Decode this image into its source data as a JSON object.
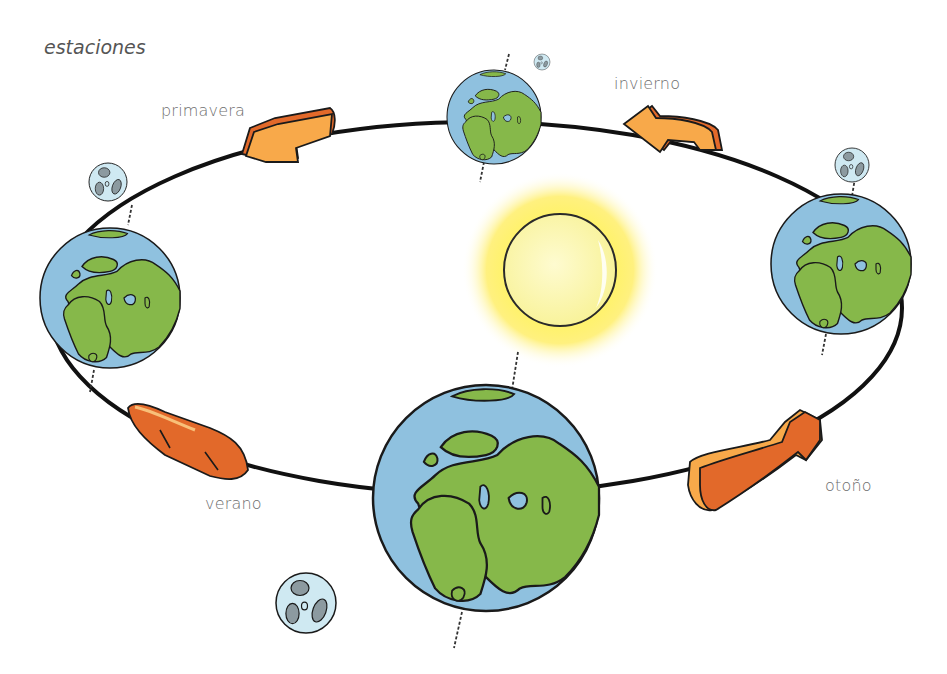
{
  "diagram": {
    "title": "estaciones",
    "seasons": [
      {
        "id": "primavera",
        "label": "primavera"
      },
      {
        "id": "invierno",
        "label": "invierno"
      },
      {
        "id": "verano",
        "label": "verano"
      },
      {
        "id": "otono",
        "label": "otoño"
      }
    ],
    "bodies": {
      "sun": {
        "name": "sun"
      },
      "earth_positions": [
        "top",
        "left",
        "right",
        "bottom"
      ],
      "moon_count": 4
    },
    "colors": {
      "ocean": "#8fc1df",
      "land": "#86b84a",
      "outline": "#1a1a1a",
      "sun_core": "#fbf6a8",
      "sun_glow": "#ffe94a",
      "moon": "#cfe9f2",
      "moon_crater": "#8c9aa0",
      "arrow_light": "#f8a94a",
      "arrow_dark": "#e2692a",
      "orbit": "#111111",
      "label_text": "#6e6e6e"
    },
    "icons": {
      "orbit_arrows": [
        "arrow-primavera-icon",
        "arrow-invierno-icon",
        "arrow-verano-icon",
        "arrow-otono-icon"
      ]
    }
  }
}
